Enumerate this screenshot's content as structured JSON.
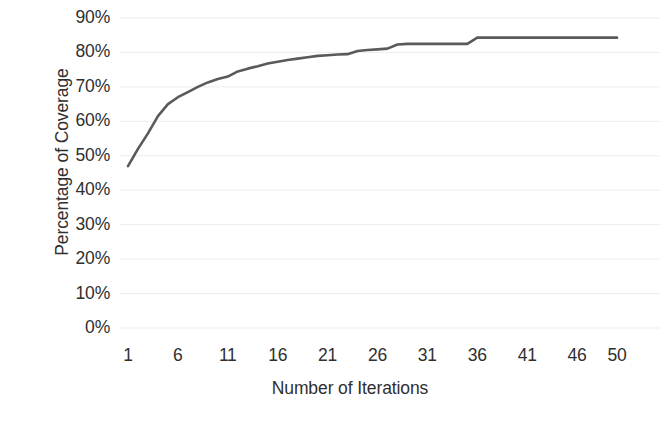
{
  "chart_data": {
    "type": "line",
    "title": "",
    "xlabel": "Number of Iterations",
    "ylabel": "Percentage of Coverage",
    "xlim": [
      1,
      50
    ],
    "ylim": [
      0,
      0.9
    ],
    "grid": true,
    "grid_axis": "y",
    "legend": false,
    "legend_position": "none",
    "y_tick_labels": [
      "90%",
      "80%",
      "70%",
      "60%",
      "50%",
      "40%",
      "30%",
      "20%",
      "10%",
      "0%"
    ],
    "y_tick_values": [
      90,
      80,
      70,
      60,
      50,
      40,
      30,
      20,
      10,
      0
    ],
    "y_tick_format": "percent",
    "x_tick_labels": [
      "1",
      "6",
      "11",
      "16",
      "21",
      "26",
      "31",
      "36",
      "41",
      "46",
      "50"
    ],
    "x_tick_values": [
      1,
      6,
      11,
      16,
      21,
      26,
      31,
      36,
      41,
      46,
      50
    ],
    "x": [
      1,
      2,
      3,
      4,
      5,
      6,
      7,
      8,
      9,
      10,
      11,
      12,
      13,
      14,
      15,
      16,
      17,
      18,
      19,
      20,
      21,
      22,
      23,
      24,
      25,
      26,
      27,
      28,
      29,
      30,
      31,
      32,
      33,
      34,
      35,
      36,
      37,
      38,
      39,
      40,
      41,
      42,
      43,
      44,
      45,
      46,
      47,
      48,
      49,
      50
    ],
    "series": [
      {
        "name": "Coverage",
        "color": "#5a5a5a",
        "line_width": 2.6,
        "marker": "none",
        "values": [
          47.0,
          52.0,
          56.5,
          61.5,
          65.0,
          67.0,
          68.5,
          70.0,
          71.3,
          72.3,
          73.0,
          74.5,
          75.3,
          76.0,
          76.8,
          77.3,
          77.8,
          78.2,
          78.6,
          79.0,
          79.2,
          79.4,
          79.5,
          80.4,
          80.7,
          80.9,
          81.1,
          82.3,
          82.5,
          82.5,
          82.5,
          82.5,
          82.5,
          82.5,
          82.5,
          84.3,
          84.3,
          84.3,
          84.3,
          84.3,
          84.3,
          84.3,
          84.3,
          84.3,
          84.3,
          84.3,
          84.3,
          84.3,
          84.3,
          84.3
        ]
      }
    ],
    "annotations": []
  },
  "axes": {
    "y_title": "Percentage of Coverage",
    "x_title": "Number of Iterations"
  },
  "style": {
    "background": "#ffffff",
    "line_color": "#5a5a5a",
    "grid_color": "#ededed",
    "text_color": "#2f2f2f"
  }
}
